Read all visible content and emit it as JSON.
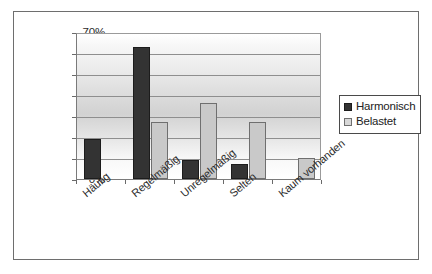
{
  "chart_data": {
    "type": "bar",
    "title": "",
    "xlabel": "",
    "ylabel": "",
    "ylim": [
      0,
      70
    ],
    "ytick_step": 10,
    "grid": true,
    "legend_position": "right",
    "categories": [
      "Häufig",
      "Regelmäßig",
      "Unregelmäßig",
      "Selten",
      "Kaum vorhanden"
    ],
    "ytick_labels": [
      "70%",
      "60%",
      "50%",
      "40%",
      "30%",
      "20%",
      "10%",
      "0%"
    ],
    "series": [
      {
        "name": "Harmonisch",
        "color": "#333333",
        "values": [
          19,
          63,
          9,
          7,
          0
        ]
      },
      {
        "name": "Belastet",
        "color": "#c9c9c9",
        "values": [
          0,
          27,
          36,
          27,
          10
        ]
      }
    ]
  },
  "legend": {
    "items": [
      {
        "label": "Harmonisch",
        "swatch": "harmonisch"
      },
      {
        "label": "Belastet",
        "swatch": "belastet"
      }
    ]
  }
}
